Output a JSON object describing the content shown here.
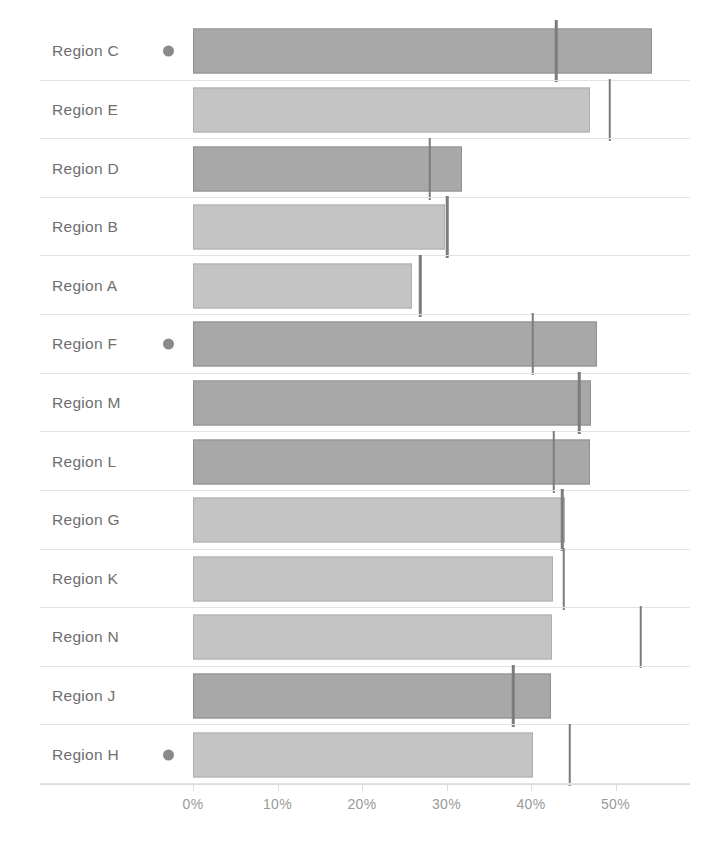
{
  "chart_data": {
    "type": "bar",
    "orientation": "horizontal",
    "title": "",
    "subtitle": "",
    "xlabel": "",
    "ylabel": "",
    "xlim": [
      0,
      57
    ],
    "grid": false,
    "legend": null,
    "axis_tick_labels": [
      "0%",
      "10%",
      "20%",
      "30%",
      "40%",
      "50%"
    ],
    "axis_tick_values": [
      0,
      10,
      20,
      30,
      40,
      50
    ],
    "value_unit": "%",
    "categories": [
      "Region C",
      "Region E",
      "Region D",
      "Region B",
      "Region A",
      "Region F",
      "Region M",
      "Region L",
      "Region G",
      "Region K",
      "Region N",
      "Region J",
      "Region H"
    ],
    "series": [
      {
        "name": "Value",
        "values": [
          54.3,
          47.0,
          31.8,
          29.8,
          25.9,
          47.8,
          47.1,
          47.0,
          44.0,
          42.6,
          42.5,
          42.4,
          40.2
        ]
      },
      {
        "name": "Reference",
        "values": [
          43.0,
          49.3,
          28.0,
          30.1,
          26.9,
          40.2,
          45.7,
          42.7,
          43.7,
          43.9,
          53.0,
          37.9,
          44.6
        ]
      }
    ],
    "bar_shades": [
      "dark",
      "light",
      "dark",
      "light",
      "light",
      "dark",
      "dark",
      "dark",
      "light",
      "light",
      "light",
      "dark",
      "light"
    ],
    "marked_categories": [
      "Region C",
      "Region F",
      "Region H"
    ],
    "colors": {
      "bar_dark": "#a8a8a8",
      "bar_dark_border": "#8f8f8f",
      "bar_light": "#c4c4c4",
      "bar_light_border": "#aeaeae",
      "reference_line": "#7c7c7c",
      "row_separator": "#e3e3e3",
      "label_text": "#6e6e6e",
      "axis_text": "#9a9a9a",
      "marker_dot": "#8a8a8a",
      "background": "#ffffff"
    }
  }
}
